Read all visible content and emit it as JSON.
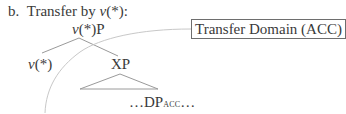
{
  "example": {
    "label": "b.",
    "title_prefix": "Transfer by ",
    "title_italic": "v",
    "title_suffix": "(*):"
  },
  "tree": {
    "root": {
      "italic": "v",
      "rest": "(*)P"
    },
    "left_child": {
      "italic": "v",
      "rest": "(*)"
    },
    "right_child": "XP",
    "leaf": {
      "prefix": "…DP",
      "subscript": "ACC",
      "suffix": "…"
    }
  },
  "annotation": {
    "box_label": "Transfer Domain (ACC)"
  },
  "colors": {
    "text": "#3a3a3a",
    "lines": "#9a9a9a",
    "curve": "#c8c8c8"
  }
}
